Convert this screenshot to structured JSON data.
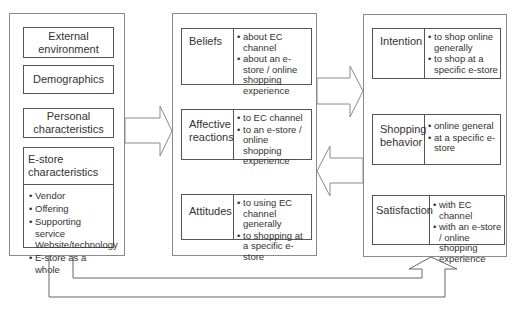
{
  "left_column": {
    "boxes": [
      {
        "label": "External environment"
      },
      {
        "label": "Demographics"
      },
      {
        "label": "Personal characteristics"
      }
    ],
    "estore": {
      "label": "E-store characteristics",
      "items": [
        "Vendor",
        "Offering",
        "Supporting service Website/technology",
        "E-store as a whole"
      ]
    }
  },
  "middle_column": {
    "boxes": [
      {
        "label": "Beliefs",
        "items": [
          "about EC channel",
          "about an e-store / online shopping experience"
        ]
      },
      {
        "label": "Affective reactions",
        "items": [
          "to EC channel",
          "to an e-store / online shopping experience"
        ]
      },
      {
        "label": "Attitudes",
        "items": [
          "to using EC channel generally",
          "to shopping at a specific e-store"
        ]
      }
    ]
  },
  "right_column": {
    "boxes": [
      {
        "label": "Intention",
        "items": [
          "to shop online generally",
          "to shop at a specific e-store"
        ]
      },
      {
        "label": "Shopping behavior",
        "items": [
          "online general",
          "at a specific e-store"
        ]
      },
      {
        "label": "Satisfaction",
        "items": [
          "with EC channel",
          "with an e-store / online shopping experience"
        ]
      }
    ]
  },
  "arrows": [
    {
      "from": "left_column",
      "to": "middle_column",
      "direction": "right"
    },
    {
      "from": "middle_column",
      "to": "right_column",
      "direction": "right"
    },
    {
      "from": "right_column",
      "to": "middle_column",
      "direction": "left"
    },
    {
      "from": "left_column",
      "to": "right_column",
      "direction": "up",
      "type": "feedback-lines"
    }
  ],
  "colors": {
    "line": "#555555",
    "outer_border": "#8a8a8a",
    "text": "#333333"
  }
}
